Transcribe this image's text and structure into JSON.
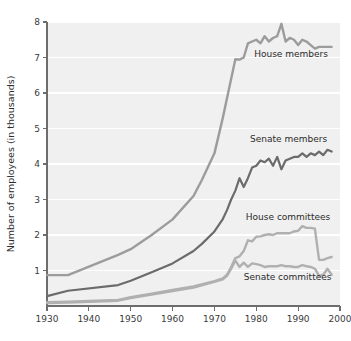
{
  "chart_data": {
    "type": "line",
    "title": "",
    "subtitle": "",
    "xlabel": "",
    "ylabel": "Number of employees (in thousands)",
    "xlim": [
      1930,
      2000
    ],
    "ylim": [
      0,
      8
    ],
    "grid": "horizontal-white-gridlines",
    "legend": "inline-series-labels",
    "xticks": [
      1930,
      1940,
      1950,
      1960,
      1970,
      1980,
      1990,
      2000
    ],
    "xtick_labels": [
      "1930",
      "1940",
      "1950",
      "1960",
      "1970",
      "1980",
      "1990",
      "2000"
    ],
    "yticks": [
      1,
      2,
      3,
      4,
      5,
      6,
      7,
      8
    ],
    "ytick_labels": [
      "1",
      "2",
      "3",
      "4",
      "5",
      "6",
      "7",
      "8"
    ],
    "series": [
      {
        "name": "House members",
        "color": "#9c9c9c",
        "label_x": 1979.5,
        "label_y": 7.02,
        "x": [
          1930,
          1935,
          1947,
          1950,
          1955,
          1960,
          1965,
          1967,
          1970,
          1972,
          1974,
          1975,
          1976,
          1977,
          1978,
          1979,
          1980,
          1981,
          1982,
          1983,
          1984,
          1985,
          1986,
          1987,
          1988,
          1989,
          1990,
          1991,
          1992,
          1993,
          1994,
          1995,
          1996,
          1997,
          1998
        ],
        "values": [
          0.87,
          0.87,
          1.44,
          1.6,
          2.0,
          2.44,
          3.1,
          3.55,
          4.3,
          5.3,
          6.4,
          6.95,
          6.94,
          7.0,
          7.4,
          7.45,
          7.5,
          7.4,
          7.6,
          7.45,
          7.55,
          7.6,
          7.95,
          7.45,
          7.55,
          7.5,
          7.35,
          7.5,
          7.45,
          7.35,
          7.25,
          7.3,
          7.3,
          7.3,
          7.3
        ]
      },
      {
        "name": "Senate members",
        "color": "#6b6b6b",
        "label_x": 1978.5,
        "label_y": 4.62,
        "x": [
          1930,
          1935,
          1947,
          1950,
          1955,
          1960,
          1965,
          1967,
          1970,
          1972,
          1973,
          1974,
          1975,
          1976,
          1977,
          1978,
          1979,
          1980,
          1981,
          1982,
          1983,
          1984,
          1985,
          1986,
          1987,
          1988,
          1989,
          1990,
          1991,
          1992,
          1993,
          1994,
          1995,
          1996,
          1997,
          1998
        ],
        "values": [
          0.28,
          0.43,
          0.59,
          0.71,
          0.95,
          1.2,
          1.55,
          1.75,
          2.1,
          2.45,
          2.7,
          3.0,
          3.25,
          3.6,
          3.35,
          3.6,
          3.9,
          3.95,
          4.1,
          4.05,
          4.15,
          3.95,
          4.2,
          3.85,
          4.1,
          4.15,
          4.2,
          4.2,
          4.3,
          4.2,
          4.3,
          4.25,
          4.35,
          4.25,
          4.4,
          4.35
        ]
      },
      {
        "name": "House committees",
        "color": "#b0b0b0",
        "label_x": 1977.5,
        "label_y": 2.43,
        "x": [
          1930,
          1935,
          1947,
          1950,
          1955,
          1960,
          1965,
          1970,
          1972,
          1973,
          1974,
          1975,
          1976,
          1977,
          1978,
          1979,
          1980,
          1981,
          1982,
          1983,
          1984,
          1985,
          1986,
          1987,
          1988,
          1989,
          1990,
          1991,
          1992,
          1993,
          1994,
          1995,
          1996,
          1997,
          1998
        ],
        "values": [
          0.11,
          0.12,
          0.17,
          0.25,
          0.35,
          0.45,
          0.55,
          0.7,
          0.78,
          0.88,
          1.1,
          1.35,
          1.4,
          1.55,
          1.85,
          1.82,
          1.95,
          1.96,
          2.0,
          2.02,
          2.0,
          2.05,
          2.05,
          2.05,
          2.05,
          2.1,
          2.12,
          2.25,
          2.2,
          2.2,
          2.18,
          1.3,
          1.3,
          1.35,
          1.38
        ]
      },
      {
        "name": "Senate committees",
        "color": "#b0b0b0",
        "label_x": 1977.0,
        "label_y": 0.74,
        "x": [
          1930,
          1935,
          1947,
          1950,
          1955,
          1960,
          1965,
          1970,
          1972,
          1973,
          1974,
          1975,
          1976,
          1977,
          1978,
          1979,
          1980,
          1981,
          1982,
          1983,
          1984,
          1985,
          1986,
          1987,
          1988,
          1989,
          1990,
          1991,
          1992,
          1993,
          1994,
          1995,
          1996,
          1997,
          1998
        ],
        "values": [
          0.08,
          0.1,
          0.15,
          0.22,
          0.32,
          0.42,
          0.52,
          0.68,
          0.75,
          0.85,
          1.05,
          1.28,
          1.1,
          1.22,
          1.1,
          1.2,
          1.18,
          1.15,
          1.1,
          1.12,
          1.12,
          1.12,
          1.15,
          1.12,
          1.12,
          1.1,
          1.1,
          1.15,
          1.12,
          1.1,
          1.05,
          0.85,
          0.88,
          1.05,
          0.88
        ]
      }
    ]
  }
}
